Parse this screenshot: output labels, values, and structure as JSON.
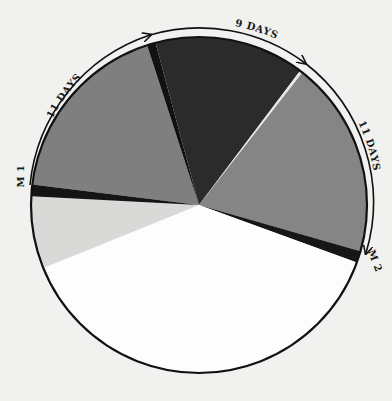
{
  "chart_data": {
    "type": "pie",
    "title": "",
    "center": [
      199,
      205
    ],
    "radius": 168,
    "slices": [
      {
        "name": "gray-upper-left",
        "start_deg": 187,
        "end_deg": 252,
        "color": "#7f7f7f"
      },
      {
        "name": "black-sliver-top",
        "start_deg": 252,
        "end_deg": 255,
        "color": "#111111"
      },
      {
        "name": "dark-top",
        "start_deg": 255,
        "end_deg": 307,
        "color": "#2b2b2b"
      },
      {
        "name": "white-divider",
        "start_deg": 307,
        "end_deg": 308,
        "color": "#e8e8e8"
      },
      {
        "name": "gray-right",
        "start_deg": 308,
        "end_deg": 376,
        "color": "#858585"
      },
      {
        "name": "black-band-right",
        "start_deg": 376,
        "end_deg": 380,
        "color": "#161616"
      },
      {
        "name": "white-bottom",
        "start_deg": 380,
        "end_deg": 518,
        "color": "#fdfdfd"
      },
      {
        "name": "light-gray-left",
        "start_deg": 518,
        "end_deg": 543,
        "color": "#d9d9d7"
      },
      {
        "name": "black-band-left",
        "start_deg": 543,
        "end_deg": 547,
        "color": "#141414"
      }
    ],
    "annotations": [
      {
        "text": "11 DAYS",
        "position": "upper-left arc"
      },
      {
        "text": "9 DAYS",
        "position": "top arc"
      },
      {
        "text": "11 DAYS",
        "position": "right arc"
      },
      {
        "text": "M 1",
        "position": "left"
      },
      {
        "text": "M 2",
        "position": "right"
      }
    ],
    "legend": null,
    "grid": false
  },
  "labels": {
    "arc_upper_left": "11 DAYS",
    "arc_top": "9 DAYS",
    "arc_right": "11 DAYS",
    "marker_left": "M 1",
    "marker_right": "M 2"
  }
}
